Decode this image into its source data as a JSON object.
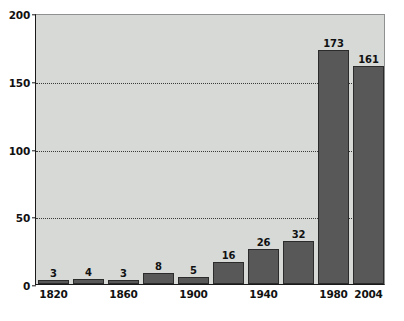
{
  "chart_data": {
    "type": "bar",
    "title": "",
    "subtitle": "",
    "xlabel": "",
    "ylabel": "",
    "categories": [
      "1820",
      "1840",
      "1860",
      "1880",
      "1900",
      "1920",
      "1940",
      "1960",
      "1980",
      "2004"
    ],
    "tick_labels": [
      "1820",
      "",
      "1860",
      "",
      "1900",
      "",
      "1940",
      "",
      "1980",
      "2004"
    ],
    "values": [
      3,
      4,
      3,
      8,
      5,
      16,
      26,
      32,
      173,
      161
    ],
    "data_labels": [
      "3",
      "4",
      "3",
      "8",
      "5",
      "16",
      "26",
      "32",
      "173",
      "161"
    ],
    "ylim": [
      0,
      200
    ],
    "yticks": [
      0,
      50,
      100,
      150,
      200
    ],
    "ytick_labels": [
      "0",
      "50",
      "100",
      "150",
      "200"
    ],
    "grid": true,
    "grid_axis": "y",
    "grid_style": "dotted",
    "legend": false,
    "legend_position": "none",
    "colors": {
      "bar_fill": "#585858",
      "bar_edge": "#2b2b2b",
      "plot_background": "#d6d9d6",
      "figure_background": "#ffffff",
      "axis_line": "#1a1a1a",
      "gridline": "#3a3a3a",
      "text": "#111111"
    }
  }
}
